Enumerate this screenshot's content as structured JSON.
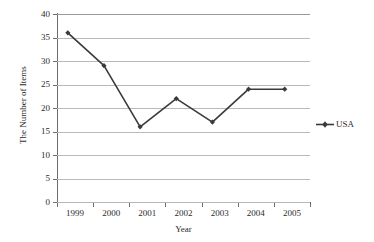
{
  "chart_data": {
    "type": "line",
    "title": "",
    "xlabel": "Year",
    "ylabel": "The Number of Items",
    "categories": [
      "1999",
      "2000",
      "2001",
      "2002",
      "2003",
      "2004",
      "2005"
    ],
    "series": [
      {
        "name": "USA",
        "values": [
          36,
          29,
          16,
          22,
          17,
          24,
          24
        ],
        "color": "#3a3a3a",
        "marker": "diamond"
      }
    ],
    "ylim": [
      0,
      40
    ],
    "ytick_step": 5,
    "yticks": [
      "0",
      "5",
      "10",
      "15",
      "20",
      "25",
      "30",
      "35",
      "40"
    ],
    "grid": "horizontal",
    "legend_position": "right",
    "gridline_color": "#b9b9b9",
    "axis_color": "#6e6e6e",
    "background": "#ffffff"
  },
  "legend": {
    "entries": [
      {
        "label": "USA",
        "marker": "diamond-line-marker"
      }
    ]
  }
}
